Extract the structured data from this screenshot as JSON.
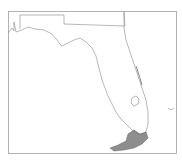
{
  "map": {
    "region": "Florida",
    "frame_color": "#999999",
    "outline_color": "#888888",
    "range_color": "#7a7a7a",
    "background": "#ffffff"
  }
}
